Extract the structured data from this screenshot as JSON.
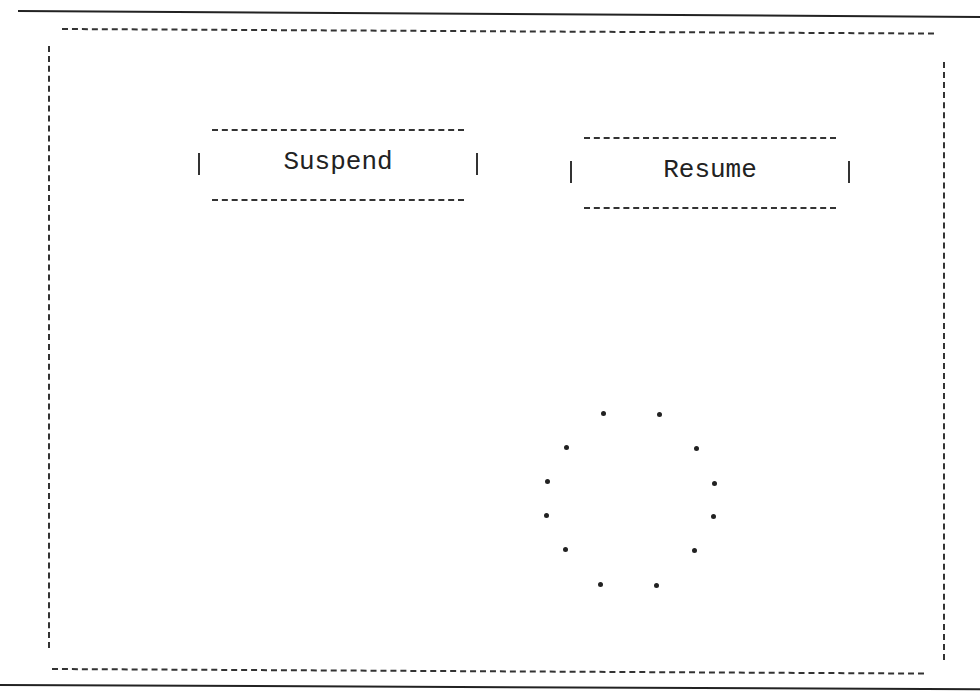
{
  "buttons": {
    "suspend": {
      "label": "Suspend"
    },
    "resume": {
      "label": "Resume"
    }
  },
  "spinner": {
    "icon": "loading-spinner-icon",
    "dot_count": 12
  }
}
